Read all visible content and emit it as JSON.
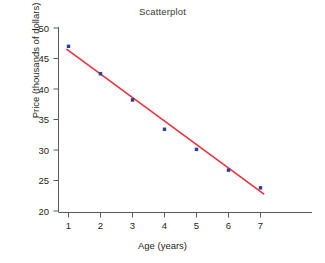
{
  "chart_data": {
    "type": "scatter",
    "title": "Scatterplot",
    "xlabel": "Age (years)",
    "ylabel": "Price (thousands of dollars)",
    "x": [
      1,
      2,
      3,
      4,
      5,
      6,
      7
    ],
    "values": [
      47.0,
      42.5,
      38.2,
      33.4,
      30.1,
      26.7,
      23.8
    ],
    "series": [
      {
        "name": "Price observations",
        "x": [
          1,
          2,
          3,
          4,
          5,
          6,
          7
        ],
        "values": [
          47.0,
          42.5,
          38.2,
          33.4,
          30.1,
          26.7,
          23.8
        ],
        "marker": "square",
        "color": "#2b3f8c"
      },
      {
        "name": "Trend line",
        "type": "line",
        "x": [
          0.95,
          7.1
        ],
        "values": [
          46.5,
          22.8
        ],
        "color": "#e8323c"
      }
    ],
    "xlim": [
      0.6,
      7.45
    ],
    "ylim": [
      20,
      50
    ],
    "xticks": [
      1,
      2,
      3,
      4,
      5,
      6,
      7
    ],
    "xticklabels": [
      "1",
      "2",
      "3",
      "4",
      "5",
      "6",
      "7"
    ],
    "yticks": [
      20,
      25,
      30,
      35,
      40,
      45,
      50
    ],
    "yticklabels": [
      "20",
      "25",
      "30",
      "35",
      "40",
      "45",
      "50"
    ],
    "grid": false,
    "legend": null,
    "colors": {
      "marker": "#2b3f8c",
      "trend_line": "#e8323c",
      "axis": "#58595b",
      "background": "#ffffff",
      "text": "#231f20"
    }
  },
  "axes": {
    "y_tick_labels": [
      "50",
      "45",
      "40",
      "35",
      "30",
      "25",
      "20"
    ],
    "x_tick_labels": [
      "1",
      "2",
      "3",
      "4",
      "5",
      "6",
      "7"
    ]
  }
}
